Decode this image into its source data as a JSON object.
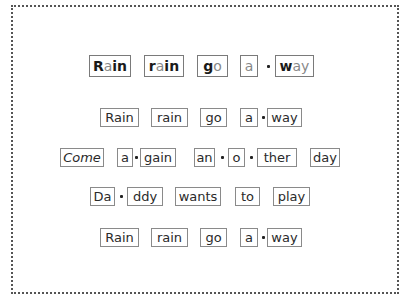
{
  "worksheet": {
    "lines": [
      {
        "words": [
          {
            "parts": [
              {
                "t": "R",
                "v": false
              },
              {
                "t": "a",
                "v": true
              },
              {
                "t": "in",
                "v": false
              }
            ]
          },
          {
            "parts": [
              {
                "t": "r",
                "v": false
              },
              {
                "t": "a",
                "v": true
              },
              {
                "t": "in",
                "v": false
              }
            ]
          },
          {
            "parts": [
              {
                "t": "g",
                "v": false
              },
              {
                "t": "o",
                "v": true
              }
            ]
          },
          {
            "parts": [
              {
                "t": "a",
                "v": true
              }
            ]
          },
          {
            "parts": [
              {
                "t": "w",
                "v": false
              },
              {
                "t": "ay",
                "v": true
              }
            ]
          }
        ]
      },
      {
        "text": [
          "Rain",
          "rain",
          "go",
          "a",
          "way"
        ]
      },
      {
        "text": [
          "Come",
          "a",
          "gain",
          "an",
          "o",
          "ther",
          "day"
        ]
      },
      {
        "text": [
          "Da",
          "ddy",
          "wants",
          "to",
          "play"
        ]
      },
      {
        "text": [
          "Rain",
          "rain",
          "go",
          "a",
          "way"
        ]
      }
    ],
    "syllable_separator": "•"
  }
}
